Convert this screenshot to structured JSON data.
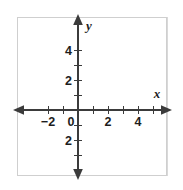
{
  "figure": {
    "kind": "coordinate-plane",
    "width": 183,
    "height": 190,
    "background_color": "#ffffff"
  },
  "chart_data": {
    "type": "scatter",
    "title": "",
    "subtitle": "",
    "xlabel": "x",
    "ylabel": "y",
    "xlim": [
      -3,
      6
    ],
    "ylim": [
      -4,
      5
    ],
    "grid": true,
    "legend": false,
    "legend_position": "none",
    "series": [],
    "x": [],
    "y": [],
    "annotations": []
  },
  "grid": {
    "line_color": "#d9d9d9",
    "frame_color": "#cfcfcf",
    "cell_size_px": 15,
    "left_px": 17,
    "top_px": 17,
    "right_px": 167,
    "bottom_px": 176,
    "columns": 10,
    "rows": 10
  },
  "axes": {
    "color": "#3b3b3b",
    "origin_px": {
      "x": 78,
      "y": 110
    },
    "unit_px": 15,
    "x_axis": {
      "name": "x",
      "name_position": "right-above",
      "arrow_left": true,
      "arrow_right": true
    },
    "y_axis": {
      "name": "y",
      "name_position": "top-right",
      "arrow_up": true,
      "arrow_down": true
    }
  },
  "x_ticks": [
    {
      "label": "−2",
      "value": -2,
      "px": 48,
      "show_label": true
    },
    {
      "label": "",
      "value": -1,
      "px": 63,
      "show_label": false
    },
    {
      "label": "0",
      "value": 0,
      "px": 78,
      "show_label": true
    },
    {
      "label": "",
      "value": 1,
      "px": 93,
      "show_label": false
    },
    {
      "label": "2",
      "value": 2,
      "px": 108,
      "show_label": true
    },
    {
      "label": "",
      "value": 3,
      "px": 123,
      "show_label": false
    },
    {
      "label": "4",
      "value": 4,
      "px": 138,
      "show_label": true
    },
    {
      "label": "",
      "value": 5,
      "px": 153,
      "show_label": false
    }
  ],
  "y_ticks": [
    {
      "label": "4",
      "value": 4,
      "px": 50,
      "show_label": true
    },
    {
      "label": "",
      "value": 3,
      "px": 65,
      "show_label": false
    },
    {
      "label": "2",
      "value": 2,
      "px": 80,
      "show_label": true
    },
    {
      "label": "",
      "value": 1,
      "px": 95,
      "show_label": false
    },
    {
      "label": "",
      "value": -1,
      "px": 125,
      "show_label": false
    },
    {
      "label": "2",
      "value": -2,
      "px": 140,
      "show_label": true
    },
    {
      "label": "",
      "value": -3,
      "px": 155,
      "show_label": false
    }
  ],
  "x_tick_label_baseline_px": 126,
  "y_tick_label_right_px": 72
}
